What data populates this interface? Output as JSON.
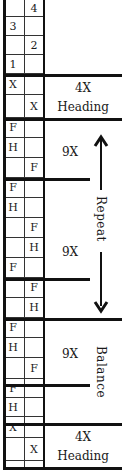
{
  "rows": [
    {
      "col1": "",
      "col2": "4"
    },
    {
      "col1": "3",
      "col2": ""
    },
    {
      "col1": "",
      "col2": "2"
    },
    {
      "col1": "1",
      "col2": ""
    },
    {
      "col1": "X",
      "col2": ""
    },
    {
      "col1": "",
      "col2": "X"
    },
    {
      "col1": "F",
      "col2": ""
    },
    {
      "col1": "H",
      "col2": ""
    },
    {
      "col1": "",
      "col2": "F"
    },
    {
      "col1": "F",
      "col2": ""
    },
    {
      "col1": "H",
      "col2": ""
    },
    {
      "col1": "",
      "col2": "F"
    },
    {
      "col1": "",
      "col2": "H"
    },
    {
      "col1": "F",
      "col2": ""
    },
    {
      "col1": "",
      "col2": "F"
    },
    {
      "col1": "",
      "col2": "H"
    },
    {
      "col1": "F",
      "col2": ""
    },
    {
      "col1": "H",
      "col2": ""
    },
    {
      "col1": "",
      "col2": "F"
    },
    {
      "col1": "F",
      "col2": ""
    },
    {
      "col1": "H",
      "col2": ""
    },
    {
      "col1": "X",
      "col2": ""
    },
    {
      "col1": "",
      "col2": "X"
    }
  ],
  "sections": {
    "heading_top": {
      "count": "4X",
      "name": "Heading"
    },
    "block1": {
      "count": "9X"
    },
    "block2": {
      "count": "9X"
    },
    "block3": {
      "count": "9X"
    },
    "heading_bottom": {
      "count": "4X",
      "name": "Heading"
    }
  },
  "annotations": {
    "repeat": "Repeat",
    "balance": "Balance"
  }
}
